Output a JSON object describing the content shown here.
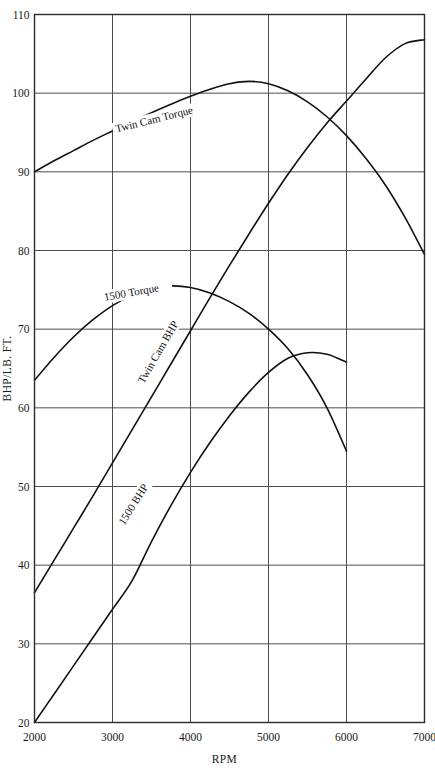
{
  "chart_data": {
    "type": "line",
    "title": "",
    "xlabel": "RPM",
    "ylabel": "BHP/LB. FT.",
    "xlim": [
      2000,
      7000
    ],
    "ylim": [
      20,
      110
    ],
    "xticks": [
      2000,
      3000,
      4000,
      5000,
      6000,
      7000
    ],
    "yticks": [
      20,
      30,
      40,
      50,
      60,
      70,
      80,
      90,
      100,
      110
    ],
    "grid": true,
    "legend": "inline-curve-labels",
    "series": [
      {
        "name": "Twin Cam Torque",
        "label": "Twin Cam Torque",
        "color": "#111111",
        "x": [
          2000,
          2250,
          2500,
          2750,
          3000,
          3250,
          3500,
          3750,
          4000,
          4250,
          4500,
          4750,
          5000,
          5250,
          5500,
          5750,
          6000,
          6250,
          6500,
          6750,
          7000
        ],
        "y": [
          90.0,
          91.4,
          92.7,
          94.0,
          95.2,
          96.4,
          97.5,
          98.6,
          99.6,
          100.5,
          101.2,
          101.5,
          101.2,
          100.3,
          98.9,
          97.0,
          94.6,
          91.7,
          88.3,
          84.2,
          79.5
        ]
      },
      {
        "name": "Twin Cam BHP",
        "label": "Twin Cam BHP",
        "color": "#111111",
        "x": [
          2000,
          2250,
          2500,
          2750,
          3000,
          3250,
          3500,
          3750,
          4000,
          4250,
          4500,
          4750,
          5000,
          5250,
          5500,
          5750,
          6000,
          6250,
          6500,
          6750,
          7000
        ],
        "y": [
          36.5,
          40.6,
          44.7,
          48.8,
          53.0,
          57.2,
          61.4,
          65.6,
          69.8,
          74.0,
          78.1,
          82.1,
          86.0,
          89.7,
          93.1,
          96.2,
          99.0,
          101.8,
          104.5,
          106.3,
          106.8
        ]
      },
      {
        "name": "1500 Torque",
        "label": "1500 Torque",
        "color": "#111111",
        "x": [
          2000,
          2250,
          2500,
          2750,
          3000,
          3250,
          3500,
          3750,
          4000,
          4250,
          4500,
          4750,
          5000,
          5250,
          5500,
          5750,
          6000
        ],
        "y": [
          63.5,
          66.4,
          69.0,
          71.2,
          73.0,
          74.3,
          75.2,
          75.5,
          75.3,
          74.6,
          73.5,
          72.0,
          70.0,
          67.5,
          64.2,
          60.0,
          54.5
        ]
      },
      {
        "name": "1500 BHP",
        "label": "1500 BHP",
        "color": "#111111",
        "x": [
          2000,
          2250,
          2500,
          2750,
          3000,
          3250,
          3500,
          3750,
          4000,
          4250,
          4500,
          4750,
          5000,
          5250,
          5500,
          5750,
          6000
        ],
        "y": [
          20.0,
          23.6,
          27.2,
          30.8,
          34.4,
          38.0,
          43.0,
          47.6,
          51.8,
          55.6,
          59.0,
          62.0,
          64.5,
          66.3,
          67.0,
          66.8,
          65.8
        ]
      }
    ],
    "curve_label_placements": [
      {
        "text": "Twin Cam Torque",
        "x": 3050,
        "y": 95.0,
        "rotate": -14
      },
      {
        "text": "1500 Torque",
        "x": 2900,
        "y": 73.6,
        "rotate": -10
      },
      {
        "text": "Twin Cam BHP",
        "x": 3400,
        "y": 63.0,
        "rotate": -60
      },
      {
        "text": "1500 BHP",
        "x": 3150,
        "y": 45.0,
        "rotate": -58
      }
    ]
  }
}
